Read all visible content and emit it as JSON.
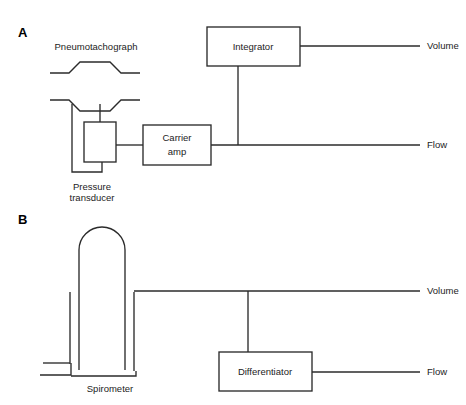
{
  "figure": {
    "background_color": "#ffffff",
    "line_color": "#2b2b2b",
    "text_color": "#1c1c1c",
    "width": 466,
    "height": 405
  },
  "panel_a": {
    "letter": "A",
    "device_label": "Pneumotachograph",
    "transducer_label_line1": "Pressure",
    "transducer_label_line2": "transducer",
    "amp_label_line1": "Carrier",
    "amp_label_line2": "amp",
    "integrator_label": "Integrator",
    "output_volume": "Volume",
    "output_flow": "Flow"
  },
  "panel_b": {
    "letter": "B",
    "device_label": "Spirometer",
    "differentiator_label": "Differentiator",
    "output_volume": "Volume",
    "output_flow": "Flow"
  }
}
